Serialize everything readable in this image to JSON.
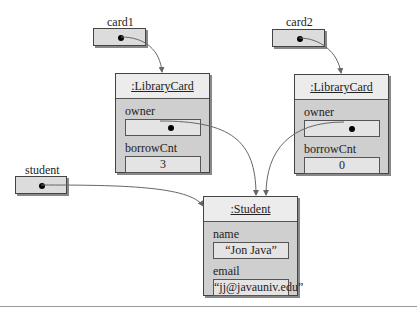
{
  "diagram": {
    "references": {
      "card1": {
        "label": "card1"
      },
      "card2": {
        "label": "card2"
      },
      "student": {
        "label": "student"
      }
    },
    "objects": {
      "libraryCard1": {
        "title": ":LibraryCard",
        "fields": [
          {
            "name": "owner",
            "value": ""
          },
          {
            "name": "borrowCnt",
            "value": "3"
          }
        ]
      },
      "libraryCard2": {
        "title": ":LibraryCard",
        "fields": [
          {
            "name": "owner",
            "value": ""
          },
          {
            "name": "borrowCnt",
            "value": "0"
          }
        ]
      },
      "student": {
        "title": ":Student",
        "fields": [
          {
            "name": "name",
            "value": "“Jon Java”"
          },
          {
            "name": "email",
            "value": "“jj@javauniv.edu”"
          }
        ]
      }
    },
    "colors": {
      "box_fill": "#dcdcdc",
      "object_body": "#cfcfcf",
      "title_fill": "#ececec",
      "arrow": "#666666"
    }
  }
}
